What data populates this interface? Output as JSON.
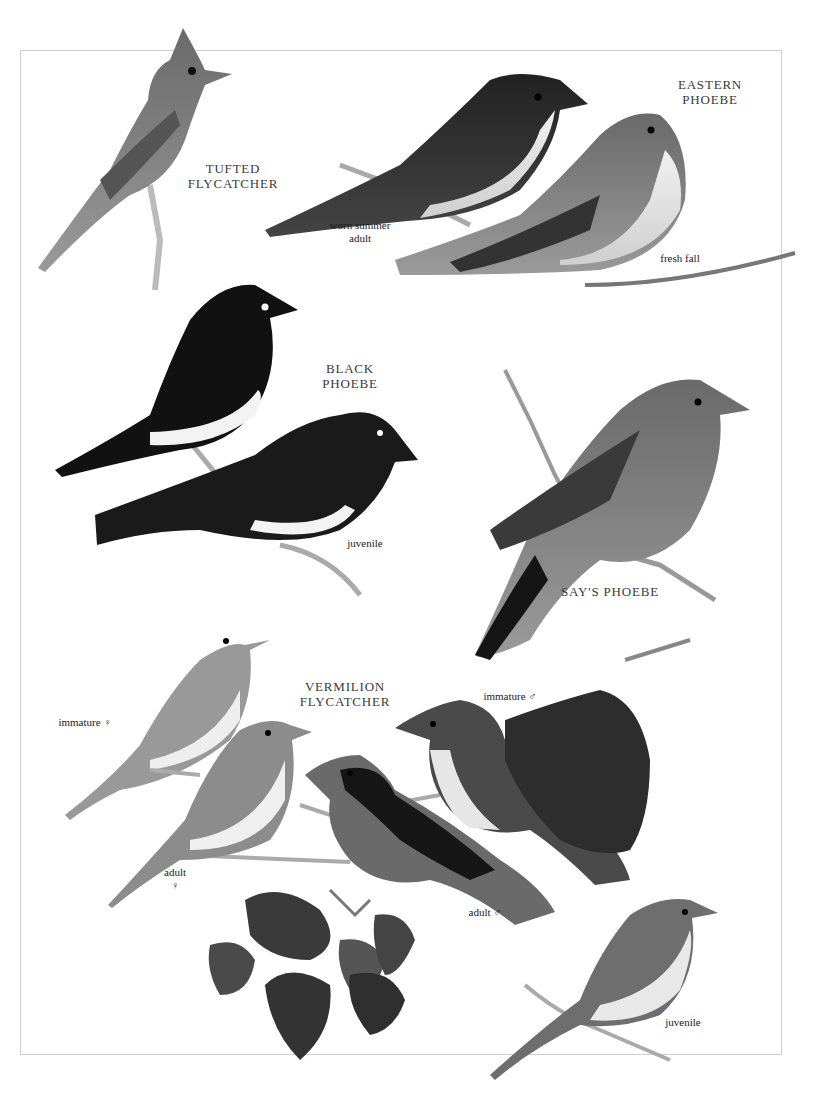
{
  "plate": {
    "species": [
      {
        "id": "tufted-flycatcher",
        "name_line1": "TUFTED",
        "name_line2": "FLYCATCHER",
        "plumages": []
      },
      {
        "id": "eastern-phoebe",
        "name_line1": "EASTERN",
        "name_line2": "PHOEBE",
        "plumages": [
          {
            "line1": "worn summer",
            "line2": "adult"
          },
          {
            "line1": "fresh fall",
            "line2": ""
          }
        ]
      },
      {
        "id": "black-phoebe",
        "name_line1": "BLACK",
        "name_line2": "PHOEBE",
        "plumages": [
          {
            "line1": "juvenile",
            "line2": ""
          }
        ]
      },
      {
        "id": "says-phoebe",
        "name_line1": "SAY'S PHOEBE",
        "name_line2": "",
        "plumages": []
      },
      {
        "id": "vermilion-flycatcher",
        "name_line1": "VERMILION",
        "name_line2": "FLYCATCHER",
        "plumages": [
          {
            "line1": "immature ♀",
            "line2": ""
          },
          {
            "line1": "immature ♂",
            "line2": ""
          },
          {
            "line1": "adult",
            "line2": "♀"
          },
          {
            "line1": "adult ♂",
            "line2": ""
          },
          {
            "line1": "juvenile",
            "line2": ""
          }
        ]
      }
    ],
    "colors": {
      "border": "#cfcfcf",
      "label": "#3a3a3a",
      "dark_bird": "#1c1c1c",
      "gray_bird": "#6f6f6f",
      "light_bird": "#d9d9d9"
    }
  }
}
